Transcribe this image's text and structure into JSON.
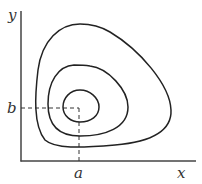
{
  "diagram": {
    "type": "phase-portrait-closed-orbits",
    "labels": {
      "y_axis": "y",
      "x_axis": "x",
      "b": "b",
      "a": "a"
    },
    "equilibrium_point": {
      "x_label": "a",
      "y_label": "b"
    },
    "orbit_count": 3,
    "colors": {
      "stroke": "#222222",
      "background": "#ffffff"
    }
  }
}
